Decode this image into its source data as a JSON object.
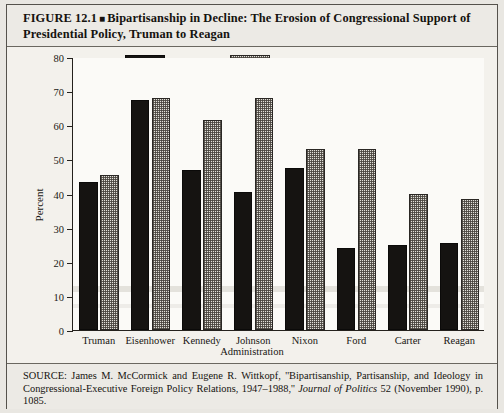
{
  "figure": {
    "number": "FIGURE 12.1",
    "bullet": "■",
    "title": "Bipartisanship in Decline: The Erosion of Congressional Support of Presidential Policy, Truman to Reagan"
  },
  "legend": {
    "items": [
      {
        "label": "House",
        "swatch": "solid-black-swatch"
      },
      {
        "label": "Senate",
        "swatch": "dotted-light-swatch"
      }
    ]
  },
  "source": {
    "prefix": "SOURCE:",
    "part1": " James M. McCormick and Eugene R. Wittkopf, ''Bipartisanship, Partisanship, and Ideology in Congressional-Executive Foreign Policy Relations, 1947–1988,'' ",
    "journal": "Journal of Politics",
    "part2": " 52 (November 1990), p. 1085."
  },
  "chart_data": {
    "type": "bar",
    "title": "Bipartisanship in Decline: The Erosion of Congressional Support of Presidential Policy, Truman to Reagan",
    "xlabel": "Administration",
    "ylabel": "Percent",
    "ylim": [
      0,
      80
    ],
    "yticks": [
      0,
      10,
      20,
      30,
      40,
      50,
      60,
      70,
      80
    ],
    "ytick_labels": [
      "0",
      "10",
      "20",
      "30",
      "40",
      "50",
      "60",
      "70",
      "80"
    ],
    "grid": false,
    "legend_position": "top-center",
    "categories": [
      "Truman",
      "Eisenhower",
      "Kennedy",
      "Johnson",
      "Nixon",
      "Ford",
      "Carter",
      "Reagan"
    ],
    "series": [
      {
        "name": "House",
        "values": [
          43.5,
          67.5,
          47,
          40.5,
          47.5,
          24,
          25,
          25.5
        ]
      },
      {
        "name": "Senate",
        "values": [
          45.5,
          68,
          61.5,
          68,
          53,
          53,
          40,
          38.5
        ]
      }
    ]
  }
}
